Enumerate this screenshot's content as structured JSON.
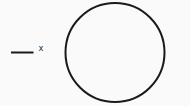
{
  "figure": {
    "canvas": {
      "width": 190,
      "height": 106,
      "background_color": "#fafafa"
    },
    "stroke_color": "#1a1a1a",
    "fill_color": "none",
    "circle": {
      "name": "circle-outline",
      "center_x": 115,
      "center_y": 52.5,
      "radius": 49.5,
      "stroke_width": 2,
      "fill": "none"
    },
    "dash": {
      "name": "dash-segment",
      "x1": 11,
      "y1": 52.5,
      "x2": 33.5,
      "y2": 52.5,
      "stroke_width": 2
    },
    "x_mark": {
      "name": "x-mark",
      "label": "x",
      "center_x": 41,
      "center_y": 49,
      "font_size": 9
    }
  }
}
